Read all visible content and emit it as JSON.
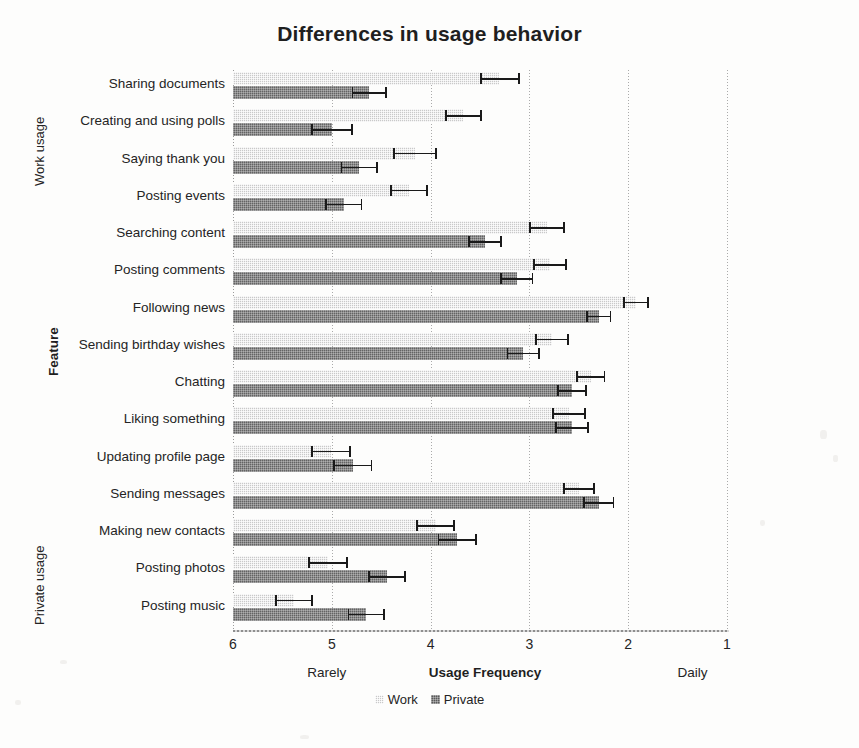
{
  "chart_data": {
    "type": "bar",
    "orientation": "horizontal",
    "title": "Differences in usage behavior",
    "xlabel": "Usage Frequency",
    "ylabel": "Feature",
    "xlim": [
      6,
      1
    ],
    "x_reversed": true,
    "grid": true,
    "xticks": [
      6,
      5,
      4,
      3,
      2,
      1
    ],
    "xtick_labels": [
      "6",
      "5",
      "4",
      "3",
      "2",
      "1"
    ],
    "x_anchor_low": "Rarely",
    "x_anchor_high": "Daily",
    "legend_position": "bottom",
    "group_labels": [
      "Work usage",
      "Private usage"
    ],
    "categories": [
      "Sharing documents",
      "Creating and using polls",
      "Saying thank you",
      "Posting events",
      "Searching content",
      "Posting comments",
      "Following news",
      "Sending birthday wishes",
      "Chatting",
      "Liking something",
      "Updating profile page",
      "Sending messages",
      "Making new contacts",
      "Posting photos",
      "Posting music"
    ],
    "series": [
      {
        "name": "Work",
        "color": "#c9c9c9",
        "values": [
          3.31,
          3.67,
          4.16,
          4.22,
          2.82,
          2.79,
          1.92,
          2.77,
          2.38,
          2.6,
          5.01,
          2.5,
          3.95,
          5.04,
          5.38
        ],
        "err_low": [
          3.5,
          3.85,
          4.38,
          4.41,
          3.0,
          2.96,
          2.05,
          2.94,
          2.53,
          2.77,
          5.21,
          2.66,
          4.15,
          5.24,
          5.57
        ],
        "err_high": [
          3.1,
          3.48,
          3.94,
          4.03,
          2.64,
          2.62,
          1.79,
          2.6,
          2.23,
          2.43,
          4.81,
          2.34,
          3.75,
          4.84,
          5.19
        ]
      },
      {
        "name": "Private",
        "color": "#636363",
        "values": [
          4.62,
          5.0,
          4.72,
          4.88,
          3.45,
          3.13,
          2.3,
          3.06,
          2.57,
          2.57,
          4.79,
          2.3,
          3.73,
          4.44,
          4.65
        ],
        "err_low": [
          4.8,
          5.21,
          4.91,
          5.07,
          3.62,
          3.3,
          2.43,
          3.23,
          2.72,
          2.74,
          4.99,
          2.46,
          3.93,
          4.63,
          4.84
        ],
        "err_high": [
          4.44,
          4.79,
          4.53,
          4.69,
          3.28,
          2.96,
          2.17,
          2.89,
          2.42,
          2.4,
          4.59,
          2.14,
          3.53,
          4.25,
          4.46
        ]
      }
    ]
  },
  "legend": {
    "items": [
      {
        "label": "Work"
      },
      {
        "label": "Private"
      }
    ]
  }
}
